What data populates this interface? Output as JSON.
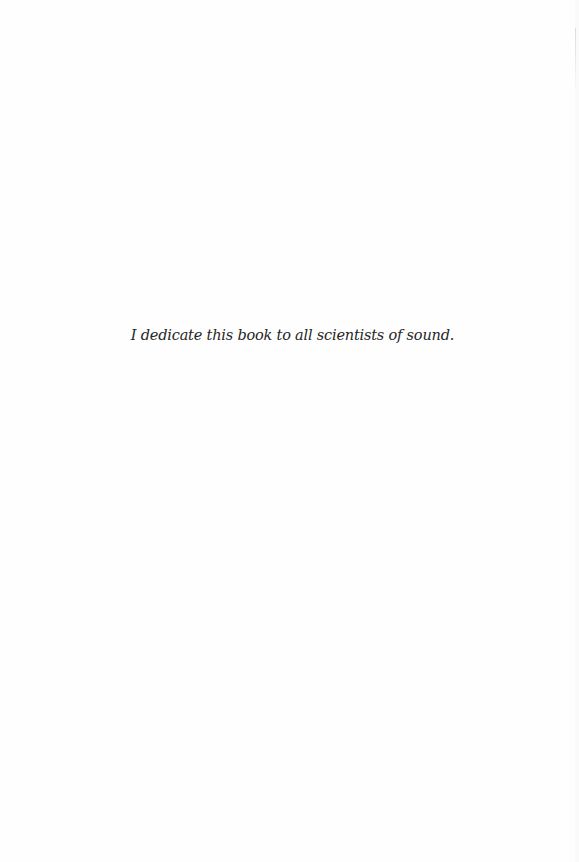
{
  "page": {
    "dedication": "I dedicate this book to all scientists of sound."
  }
}
